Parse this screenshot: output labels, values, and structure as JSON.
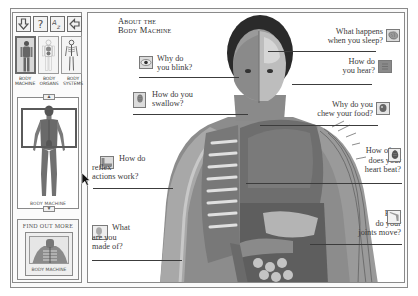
{
  "app": {
    "title": "About the Body Machine"
  },
  "toolbar": {
    "buttons": [
      {
        "name": "down-arrow",
        "glyph": "⇩"
      },
      {
        "name": "help",
        "glyph": "?"
      },
      {
        "name": "a-z-index",
        "glyph": "AZ"
      },
      {
        "name": "back-arrow",
        "glyph": "⇦"
      }
    ]
  },
  "body_selector": {
    "items": [
      {
        "label": "BODY MACHINE",
        "active": true
      },
      {
        "label": "BODY ORGANS",
        "active": false
      },
      {
        "label": "BODY SYSTEMS",
        "active": false
      }
    ]
  },
  "preview": {
    "caption": "BODY MACHINE",
    "up_glyph": "▲",
    "down_glyph": "▼"
  },
  "find_out_more": {
    "title": "FIND OUT MORE",
    "caption": "BODY MACHINE"
  },
  "main": {
    "title_line1": "About the",
    "title_line2": "Body Machine",
    "callouts": [
      {
        "id": "blink",
        "text": "Why do\nyou blink?",
        "icon": "eye-icon"
      },
      {
        "id": "sleep",
        "text": "What happens\nwhen you sleep?",
        "icon": "brain-icon"
      },
      {
        "id": "hear",
        "text": "How do\nyou hear?",
        "icon": "ear-icon"
      },
      {
        "id": "swallow",
        "text": "How do you\nswallow?",
        "icon": "throat-icon"
      },
      {
        "id": "chew",
        "text": "Why do you\nchew your food?",
        "icon": "head-icon"
      },
      {
        "id": "reflex",
        "text": "How do\nreflex\nactions work?",
        "icon": "knee-icon"
      },
      {
        "id": "heart",
        "text": "How often\ndoes your\nheart beat?",
        "icon": "heart-icon"
      },
      {
        "id": "joints",
        "text": "How\ndo your\njoints move?",
        "icon": "joint-icon"
      },
      {
        "id": "made-of",
        "text": "What\nare you\nmade of?",
        "icon": "face-icon"
      }
    ]
  },
  "colors": {
    "frame": "#8a8a8a",
    "text": "#3a3a3a",
    "background": "#ffffff"
  }
}
